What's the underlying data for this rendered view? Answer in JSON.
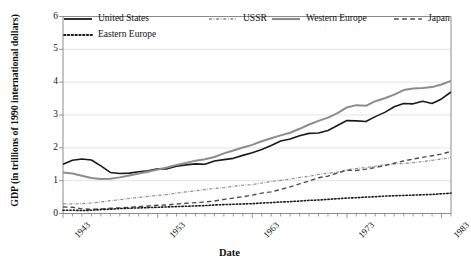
{
  "chart_data": {
    "type": "line",
    "title": "",
    "xlabel": "Date",
    "ylabel": "GDP (in trillions of 1990 international dollars)",
    "xlim": [
      1943,
      1984
    ],
    "ylim": [
      0,
      6
    ],
    "yticks": [
      0,
      1,
      2,
      3,
      4,
      5,
      6
    ],
    "xticks": [
      1943,
      1953,
      1963,
      1973,
      1983
    ],
    "xtick_labels": [
      "1943",
      "1953",
      "1963",
      "1973",
      "1983"
    ],
    "grid": "horizontal",
    "legend_position": "top-inside",
    "x": [
      1943,
      1944,
      1945,
      1946,
      1947,
      1948,
      1949,
      1950,
      1951,
      1952,
      1953,
      1954,
      1955,
      1956,
      1957,
      1958,
      1959,
      1960,
      1961,
      1962,
      1963,
      1964,
      1965,
      1966,
      1967,
      1968,
      1969,
      1970,
      1971,
      1972,
      1973,
      1974,
      1975,
      1976,
      1977,
      1978,
      1979,
      1980,
      1981,
      1982,
      1983,
      1984
    ],
    "series": [
      {
        "name": "United States",
        "style": "solid",
        "color": "#1a1a1a",
        "width": 1.6,
        "values": [
          1.5,
          1.62,
          1.66,
          1.63,
          1.45,
          1.25,
          1.22,
          1.23,
          1.27,
          1.3,
          1.36,
          1.36,
          1.44,
          1.48,
          1.51,
          1.5,
          1.6,
          1.64,
          1.68,
          1.77,
          1.85,
          1.95,
          2.07,
          2.21,
          2.27,
          2.37,
          2.44,
          2.45,
          2.53,
          2.68,
          2.83,
          2.82,
          2.8,
          2.95,
          3.08,
          3.25,
          3.35,
          3.34,
          3.42,
          3.35,
          3.49,
          3.7
        ]
      },
      {
        "name": "USSR",
        "style": "dashdot",
        "color": "#8c8c8c",
        "width": 1.2,
        "values": [
          0.3,
          0.29,
          0.3,
          0.32,
          0.35,
          0.39,
          0.42,
          0.46,
          0.49,
          0.52,
          0.55,
          0.58,
          0.62,
          0.66,
          0.69,
          0.73,
          0.76,
          0.79,
          0.83,
          0.86,
          0.88,
          0.93,
          0.97,
          1.01,
          1.05,
          1.1,
          1.13,
          1.19,
          1.23,
          1.26,
          1.33,
          1.37,
          1.4,
          1.44,
          1.48,
          1.51,
          1.52,
          1.55,
          1.58,
          1.62,
          1.66,
          1.7
        ]
      },
      {
        "name": "Western Europe",
        "style": "solid",
        "color": "#8c8c8c",
        "width": 2.0,
        "values": [
          1.25,
          1.22,
          1.15,
          1.08,
          1.05,
          1.06,
          1.1,
          1.16,
          1.22,
          1.27,
          1.34,
          1.4,
          1.48,
          1.54,
          1.61,
          1.65,
          1.72,
          1.83,
          1.92,
          2.01,
          2.09,
          2.2,
          2.29,
          2.38,
          2.46,
          2.58,
          2.71,
          2.82,
          2.92,
          3.06,
          3.23,
          3.3,
          3.28,
          3.42,
          3.51,
          3.62,
          3.76,
          3.81,
          3.82,
          3.85,
          3.93,
          4.04
        ]
      },
      {
        "name": "Japan",
        "style": "dashed",
        "color": "#4d4d4d",
        "width": 1.4,
        "values": [
          0.2,
          0.19,
          0.14,
          0.13,
          0.14,
          0.16,
          0.17,
          0.19,
          0.21,
          0.23,
          0.25,
          0.26,
          0.29,
          0.31,
          0.33,
          0.35,
          0.38,
          0.43,
          0.47,
          0.51,
          0.56,
          0.62,
          0.66,
          0.73,
          0.81,
          0.9,
          0.99,
          1.09,
          1.14,
          1.23,
          1.32,
          1.31,
          1.35,
          1.4,
          1.46,
          1.53,
          1.6,
          1.66,
          1.71,
          1.76,
          1.81,
          1.89
        ]
      },
      {
        "name": "Eastern Europe",
        "style": "dotted",
        "color": "#1a1a1a",
        "width": 1.6,
        "values": [
          0.1,
          0.1,
          0.09,
          0.1,
          0.12,
          0.13,
          0.15,
          0.16,
          0.17,
          0.18,
          0.19,
          0.2,
          0.21,
          0.22,
          0.23,
          0.24,
          0.26,
          0.27,
          0.28,
          0.29,
          0.3,
          0.32,
          0.33,
          0.35,
          0.36,
          0.38,
          0.4,
          0.41,
          0.43,
          0.45,
          0.47,
          0.48,
          0.5,
          0.51,
          0.53,
          0.54,
          0.55,
          0.56,
          0.57,
          0.58,
          0.6,
          0.62
        ]
      }
    ]
  },
  "legend": {
    "items": [
      {
        "label": "United States",
        "style": "solid",
        "color": "#1a1a1a",
        "width": 1.8
      },
      {
        "label": "USSR",
        "style": "dashdot",
        "color": "#8c8c8c",
        "width": 1.3
      },
      {
        "label": "Western Europe",
        "style": "solid",
        "color": "#8c8c8c",
        "width": 2.2
      },
      {
        "label": "Japan",
        "style": "dashed",
        "color": "#4d4d4d",
        "width": 1.5
      },
      {
        "label": "Eastern Europe",
        "style": "dotted",
        "color": "#1a1a1a",
        "width": 1.8
      }
    ]
  },
  "axes": {
    "ytick_labels": [
      "6",
      "5",
      "4",
      "3",
      "2",
      "1",
      "0"
    ],
    "xtick_labels": [
      "1943",
      "1953",
      "1963",
      "1973",
      "1983"
    ],
    "xlabel": "Date",
    "ylabel": "GDP (in trillions of 1990 international dollars)"
  },
  "colors": {
    "axis": "#808080",
    "grid": "#d9d9d9",
    "text": "#111111",
    "background": "#ffffff"
  }
}
